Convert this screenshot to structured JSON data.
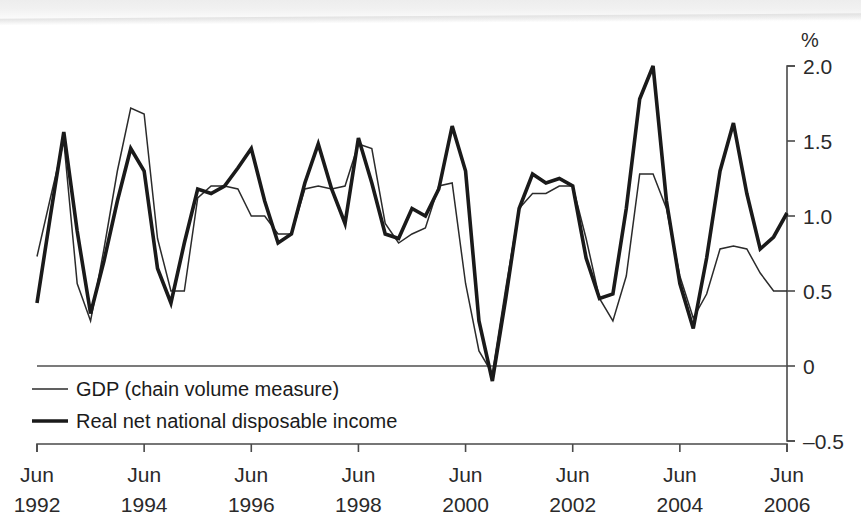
{
  "chart_data": {
    "type": "line",
    "title": "",
    "subtitle": "",
    "xlabel": "",
    "ylabel": "%",
    "unit_label": "%",
    "ylim": [
      -0.5,
      2.0
    ],
    "ytick_values": [
      2.0,
      1.5,
      1.0,
      0.5,
      0,
      -0.5
    ],
    "ytick_labels": [
      "2.0",
      "1.5",
      "1.0",
      "0.5",
      "0",
      "–0.5"
    ],
    "grid": false,
    "zero_line": true,
    "legend_position": "bottom-left",
    "x_start": "Jun 1992",
    "x_end": "Jun 2006",
    "x_frequency": "quarterly",
    "xtick_labels": [
      {
        "month": "Jun",
        "year": "1992"
      },
      {
        "month": "Jun",
        "year": "1994"
      },
      {
        "month": "Jun",
        "year": "1996"
      },
      {
        "month": "Jun",
        "year": "1998"
      },
      {
        "month": "Jun",
        "year": "2000"
      },
      {
        "month": "Jun",
        "year": "2002"
      },
      {
        "month": "Jun",
        "year": "2004"
      },
      {
        "month": "Jun",
        "year": "2006"
      }
    ],
    "xtick_values": [
      0,
      8,
      16,
      24,
      32,
      40,
      48,
      56
    ],
    "series": [
      {
        "name": "GDP (chain volume measure)",
        "style": "thin",
        "color": "#2b2b2b",
        "values": [
          0.73,
          1.12,
          1.5,
          0.55,
          0.3,
          0.78,
          1.3,
          1.72,
          1.68,
          0.85,
          0.5,
          0.5,
          1.12,
          1.2,
          1.2,
          1.18,
          1.0,
          1.0,
          0.88,
          0.88,
          1.18,
          1.2,
          1.18,
          1.2,
          1.48,
          1.45,
          0.95,
          0.82,
          0.88,
          0.92,
          1.2,
          1.22,
          0.55,
          0.1,
          -0.05,
          0.52,
          1.05,
          1.15,
          1.15,
          1.2,
          1.2,
          0.85,
          0.45,
          0.3,
          0.6,
          1.28,
          1.28,
          1.05,
          0.6,
          0.32,
          0.48,
          0.78,
          0.8,
          0.78,
          0.62,
          0.5,
          0.5
        ]
      },
      {
        "name": "Real net national disposable income",
        "style": "thick",
        "color": "#1a1a1a",
        "values": [
          0.42,
          1.0,
          1.56,
          0.9,
          0.35,
          0.7,
          1.1,
          1.45,
          1.3,
          0.65,
          0.42,
          0.82,
          1.18,
          1.15,
          1.2,
          1.32,
          1.45,
          1.1,
          0.82,
          0.88,
          1.22,
          1.48,
          1.18,
          0.95,
          1.52,
          1.22,
          0.88,
          0.85,
          1.05,
          1.0,
          1.18,
          1.6,
          1.3,
          0.3,
          -0.1,
          0.45,
          1.05,
          1.28,
          1.22,
          1.25,
          1.2,
          0.72,
          0.45,
          0.48,
          1.05,
          1.78,
          2.0,
          1.1,
          0.55,
          0.25,
          0.72,
          1.3,
          1.62,
          1.15,
          0.78,
          0.86,
          1.02
        ]
      }
    ],
    "legend": [
      {
        "label": "GDP (chain volume measure)",
        "style": "thin"
      },
      {
        "label": "Real net national disposable income",
        "style": "thick"
      }
    ]
  }
}
